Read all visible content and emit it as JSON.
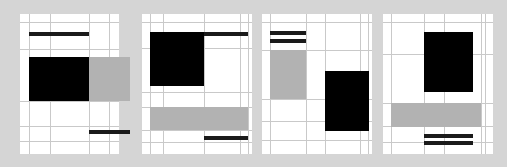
{
  "figure": {
    "canvas": {
      "width": 507,
      "height": 167
    },
    "colors": {
      "background": "#d5d5d5",
      "panel": "#ffffff",
      "rule": "#c9c9c9",
      "block_black": "#000000",
      "block_gray": "#b2b2b2",
      "bar_black": "#1a1a1a"
    },
    "panel_count": 4,
    "panel_labels": [
      "panel-1",
      "panel-2",
      "panel-3",
      "panel-4"
    ]
  },
  "chart_data": {
    "type": "heatmap",
    "xlabel": "",
    "ylabel": "",
    "grid": true,
    "legend": "none",
    "xlim": [
      0,
      507
    ],
    "ylim": [
      0,
      167
    ],
    "panels": [
      {
        "name": "panel-1",
        "x": 20,
        "y": 14,
        "w": 99,
        "h": 140,
        "vertical_rules": [
          9,
          30,
          69,
          89
        ],
        "horizontal_rules": [
          8,
          35,
          87,
          112,
          127
        ],
        "blocks": [
          {
            "kind": "black",
            "x": 9,
            "y": 43,
            "w": 60,
            "h": 44
          },
          {
            "kind": "gray",
            "x": 69,
            "y": 43,
            "w": 41,
            "h": 44
          }
        ],
        "bars": [
          {
            "kind": "black-bar",
            "x": 9,
            "y": 18,
            "w": 60,
            "h": 4
          },
          {
            "kind": "black-bar",
            "x": 69,
            "y": 116,
            "w": 41,
            "h": 4
          }
        ]
      },
      {
        "name": "panel-2",
        "x": 142,
        "y": 14,
        "w": 110,
        "h": 140,
        "vertical_rules": [
          8,
          21,
          62,
          98,
          106
        ],
        "horizontal_rules": [
          8,
          34,
          78,
          93,
          116,
          128
        ],
        "blocks": [
          {
            "kind": "black",
            "x": 8,
            "y": 18,
            "w": 54,
            "h": 54
          },
          {
            "kind": "gray",
            "x": 8,
            "y": 93,
            "w": 54,
            "h": 23
          },
          {
            "kind": "gray",
            "x": 62,
            "y": 93,
            "w": 44,
            "h": 23
          }
        ],
        "bars": [
          {
            "kind": "black-bar",
            "x": 62,
            "y": 18,
            "w": 44,
            "h": 4
          },
          {
            "kind": "black-bar",
            "x": 62,
            "y": 122,
            "w": 44,
            "h": 4
          }
        ]
      },
      {
        "name": "panel-3",
        "x": 262,
        "y": 14,
        "w": 110,
        "h": 140,
        "vertical_rules": [
          8,
          44,
          63,
          98,
          106
        ],
        "horizontal_rules": [
          8,
          36,
          85,
          107,
          126
        ],
        "blocks": [
          {
            "kind": "gray",
            "x": 8,
            "y": 36,
            "w": 36,
            "h": 49
          },
          {
            "kind": "black",
            "x": 63,
            "y": 57,
            "w": 44,
            "h": 60
          }
        ],
        "bars": [
          {
            "kind": "black-bar",
            "x": 8,
            "y": 17,
            "w": 36,
            "h": 4
          },
          {
            "kind": "black-bar",
            "x": 8,
            "y": 25,
            "w": 36,
            "h": 4
          }
        ]
      },
      {
        "name": "panel-4",
        "x": 383,
        "y": 14,
        "w": 110,
        "h": 140,
        "vertical_rules": [
          8,
          41,
          61,
          98,
          102
        ],
        "horizontal_rules": [
          8,
          40,
          89,
          112,
          128
        ],
        "blocks": [
          {
            "kind": "black",
            "x": 41,
            "y": 18,
            "w": 49,
            "h": 60
          },
          {
            "kind": "gray",
            "x": 8,
            "y": 89,
            "w": 53,
            "h": 24
          },
          {
            "kind": "gray",
            "x": 61,
            "y": 89,
            "w": 37,
            "h": 24
          }
        ],
        "bars": [
          {
            "kind": "black-bar",
            "x": 41,
            "y": 120,
            "w": 49,
            "h": 4
          },
          {
            "kind": "black-bar",
            "x": 41,
            "y": 127,
            "w": 49,
            "h": 4
          }
        ]
      }
    ]
  }
}
